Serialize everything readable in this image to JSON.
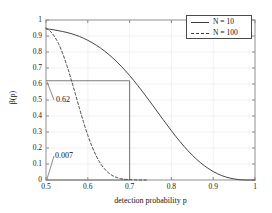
{
  "chart_data": {
    "type": "line",
    "title": "",
    "xlabel": "detection probability p",
    "ylabel": "β(p)",
    "xlim": [
      0.5,
      1
    ],
    "ylim": [
      0,
      1
    ],
    "grid": true,
    "legend_position": "top-right",
    "xticks": [
      "0.5",
      "0.6",
      "0.7",
      "0.8",
      "0.9",
      "1"
    ],
    "xtick_values": [
      0.5,
      0.6,
      0.7,
      0.8,
      0.9,
      1
    ],
    "yticks": [
      "0",
      "0.1",
      "0.2",
      "0.3",
      "0.4",
      "0.5",
      "0.6",
      "0.7",
      "0.8",
      "0.9",
      "1"
    ],
    "ytick_values": [
      0,
      0.1,
      0.2,
      0.3,
      0.4,
      0.5,
      0.6,
      0.7,
      0.8,
      0.9,
      1
    ],
    "series": [
      {
        "name": "N = 10",
        "style": "solid",
        "color": "#3b3b3b",
        "x": [
          0.5,
          0.52,
          0.54,
          0.56,
          0.58,
          0.6,
          0.62,
          0.64,
          0.66,
          0.68,
          0.7,
          0.72,
          0.74,
          0.76,
          0.78,
          0.8,
          0.82,
          0.84,
          0.86,
          0.88,
          0.9,
          0.92,
          0.94,
          0.96,
          0.98,
          1.0
        ],
        "y": [
          0.945,
          0.938,
          0.928,
          0.915,
          0.897,
          0.873,
          0.843,
          0.806,
          0.762,
          0.711,
          0.653,
          0.589,
          0.521,
          0.45,
          0.378,
          0.308,
          0.242,
          0.182,
          0.13,
          0.087,
          0.053,
          0.028,
          0.012,
          0.003,
          0.0,
          0.0
        ]
      },
      {
        "name": "N = 100",
        "style": "dashed",
        "color": "#3b3b3b",
        "x": [
          0.5,
          0.51,
          0.52,
          0.53,
          0.54,
          0.55,
          0.56,
          0.57,
          0.58,
          0.59,
          0.6,
          0.61,
          0.62,
          0.63,
          0.64,
          0.65,
          0.66,
          0.67,
          0.68,
          0.69,
          0.7,
          0.72,
          0.74
        ],
        "y": [
          0.95,
          0.93,
          0.898,
          0.852,
          0.79,
          0.715,
          0.63,
          0.54,
          0.448,
          0.36,
          0.28,
          0.21,
          0.152,
          0.105,
          0.07,
          0.044,
          0.026,
          0.015,
          0.008,
          0.004,
          0.002,
          0.0,
          0.0
        ]
      }
    ],
    "reference_lines": [
      {
        "name": "horizontal-reference",
        "orientation": "horizontal",
        "y": 0.62,
        "x_from": 0.5,
        "x_to": 0.7
      },
      {
        "name": "vertical-reference",
        "orientation": "vertical",
        "x": 0.7,
        "y_from": 0.0,
        "y_to": 0.62
      },
      {
        "name": "baseline-reference",
        "orientation": "horizontal",
        "y": 0.0,
        "x_from": 0.5,
        "x_to": 0.7
      }
    ],
    "annotations": [
      {
        "label": "0.62",
        "points_to_x": 0.5,
        "points_to_y": 0.62
      },
      {
        "label": "0.007",
        "points_to_x": 0.5,
        "points_to_y": 0.0
      }
    ]
  }
}
